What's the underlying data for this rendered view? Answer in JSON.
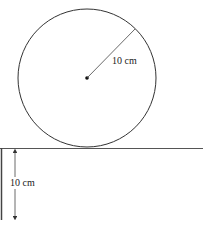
{
  "diagram": {
    "type": "geometry-figure",
    "circle": {
      "radius_label": "10 cm",
      "center_dot": true
    },
    "step": {
      "height_label": "10 cm"
    },
    "colors": {
      "stroke": "#333333",
      "background": "#ffffff"
    }
  }
}
